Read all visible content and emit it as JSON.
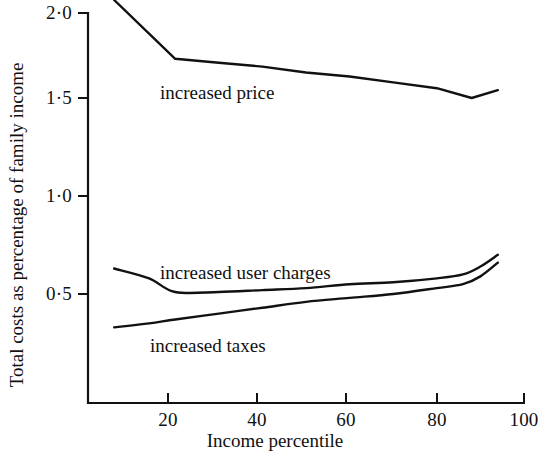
{
  "chart_data": {
    "type": "line",
    "title": "",
    "xlabel": "Income percentile",
    "ylabel": "Total costs as percentage of family income",
    "xlim": [
      2,
      100
    ],
    "ylim": [
      0,
      2.05
    ],
    "grid": false,
    "legend_position": "inline-annotations",
    "xticks": [
      20,
      40,
      60,
      80,
      100
    ],
    "xtick_labels": [
      "20",
      "40",
      "60",
      "80",
      "100"
    ],
    "yticks": [
      0.5,
      1.0,
      1.5,
      2.0
    ],
    "ytick_labels": [
      "0·5",
      "1·0",
      "1·5",
      "2·0"
    ],
    "series": [
      {
        "name": "increased price",
        "label": "increased price",
        "x": [
          6,
          20,
          30,
          40,
          50,
          60,
          70,
          80,
          88,
          94
        ],
        "values": [
          2.0,
          1.7,
          1.68,
          1.66,
          1.63,
          1.61,
          1.58,
          1.55,
          1.5,
          1.54
        ]
      },
      {
        "name": "increased user charges",
        "label": "increased user charges",
        "x": [
          6,
          14,
          20,
          30,
          40,
          50,
          60,
          70,
          80,
          86,
          90,
          94
        ],
        "values": [
          0.63,
          0.58,
          0.51,
          0.51,
          0.52,
          0.53,
          0.55,
          0.56,
          0.58,
          0.6,
          0.64,
          0.7
        ]
      },
      {
        "name": "increased taxes",
        "label": "increased taxes",
        "x": [
          6,
          14,
          20,
          30,
          40,
          50,
          60,
          70,
          80,
          86,
          90,
          94
        ],
        "values": [
          0.33,
          0.35,
          0.37,
          0.4,
          0.43,
          0.46,
          0.48,
          0.5,
          0.53,
          0.55,
          0.59,
          0.66
        ]
      }
    ],
    "annotations": [
      {
        "text": "increased price",
        "x": 24,
        "y": 1.545
      },
      {
        "text": "increased user charges",
        "x": 24,
        "y": 0.625
      },
      {
        "text": "increased taxes",
        "x": 24,
        "y": 0.355
      }
    ],
    "line_color": "#111111"
  }
}
